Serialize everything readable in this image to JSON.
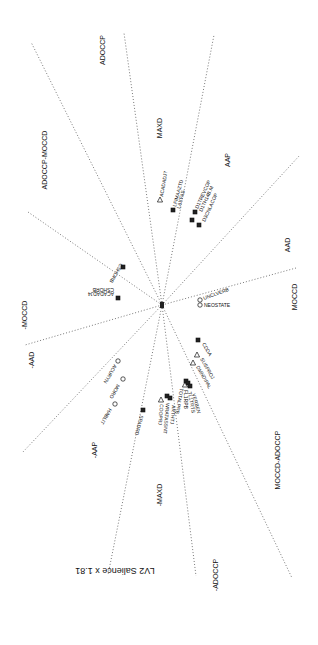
{
  "diagram": {
    "center": {
      "x": 162,
      "y": 305
    },
    "caption": "LV2 Salience x 1.81",
    "axes": [
      {
        "x2": 31,
        "y2": 42
      },
      {
        "x2": 124,
        "y2": 33
      },
      {
        "x2": 214,
        "y2": 35
      },
      {
        "x2": 300,
        "y2": 155
      },
      {
        "x2": 296,
        "y2": 268
      },
      {
        "x2": 292,
        "y2": 578
      },
      {
        "x2": 196,
        "y2": 576
      },
      {
        "x2": 108,
        "y2": 575
      },
      {
        "x2": 22,
        "y2": 453
      },
      {
        "x2": 25,
        "y2": 345
      },
      {
        "x2": 28,
        "y2": 212
      }
    ],
    "regions": [
      {
        "label": "ADOCCP",
        "x": 105,
        "y": 50,
        "rotate": -90
      },
      {
        "label": "ADOCCP-MOCCD",
        "x": 47,
        "y": 160,
        "rotate": -90
      },
      {
        "label": "MAXD",
        "x": 162,
        "y": 128,
        "rotate": -90
      },
      {
        "label": "AAP",
        "x": 230,
        "y": 160,
        "rotate": -90
      },
      {
        "label": "AAD",
        "x": 290,
        "y": 245,
        "rotate": -90
      },
      {
        "label": "MOCCD",
        "x": 297,
        "y": 297,
        "rotate": -90
      },
      {
        "label": "MOCCD-ADOCCP",
        "x": 280,
        "y": 460,
        "rotate": -90
      },
      {
        "label": "-ADOCCP",
        "x": 218,
        "y": 575,
        "rotate": -90
      },
      {
        "label": "-MAXD",
        "x": 162,
        "y": 495,
        "rotate": -90
      },
      {
        "label": "-AAP",
        "x": 97,
        "y": 450,
        "rotate": -90
      },
      {
        "label": "-AAD",
        "x": 34,
        "y": 360,
        "rotate": -90
      },
      {
        "label": "-MOCCD",
        "x": 27,
        "y": 315,
        "rotate": -90
      }
    ],
    "points": [
      {
        "label": "ACADADJ7",
        "marker": "triangle",
        "x": 160,
        "y": 200,
        "lx": 163,
        "ly": 197,
        "rotate": -80
      },
      {
        "label": "LFIMAAZTD",
        "marker": "square",
        "x": 173,
        "y": 210,
        "lx": 176,
        "ly": 207,
        "rotate": -75
      },
      {
        "label": "LAXFAS",
        "marker": "none",
        "x": 178,
        "y": 212,
        "lx": 180,
        "ly": 209,
        "rotate": -75
      },
      {
        "label": "D1TREVCOP",
        "marker": "square",
        "x": 195,
        "y": 212,
        "lx": 198,
        "ly": 209,
        "rotate": -65
      },
      {
        "label": "D1TH14B.M",
        "marker": "none",
        "x": 200,
        "y": 214,
        "lx": 202,
        "ly": 212,
        "rotate": -65
      },
      {
        "label": "D3CNLACOP",
        "marker": "square",
        "x": 199,
        "y": 225,
        "lx": 205,
        "ly": 222,
        "rotate": -65
      },
      {
        "label": "",
        "marker": "square",
        "x": 192,
        "y": 220,
        "lx": 0,
        "ly": 0,
        "rotate": 0
      },
      {
        "label": "CSHORB",
        "marker": "square",
        "x": 123,
        "y": 267,
        "lx": 120,
        "ly": 263,
        "rotate": 120
      },
      {
        "label": "ACADADJ4",
        "marker": "square",
        "x": 118,
        "y": 298,
        "lx": 114,
        "ly": 292,
        "rotate": 180
      },
      {
        "label": "CSHORB",
        "marker": "none",
        "x": 118,
        "y": 292,
        "lx": 114,
        "ly": 288,
        "rotate": 180
      },
      {
        "label": "UNCLVERB",
        "marker": "circle",
        "x": 200,
        "y": 300,
        "lx": 204,
        "ly": 300,
        "rotate": -20
      },
      {
        "label": "NEOSTATE",
        "marker": "circle",
        "x": 200,
        "y": 305,
        "lx": 204,
        "ly": 307,
        "rotate": 0
      },
      {
        "label": "CDDA",
        "marker": "square",
        "x": 198,
        "y": 340,
        "lx": 202,
        "ly": 344,
        "rotate": 60
      },
      {
        "label": "SUSPROJ",
        "marker": "triangle",
        "x": 197,
        "y": 355,
        "lx": 200,
        "ly": 359,
        "rotate": 60
      },
      {
        "label": "DMNDIPAL",
        "marker": "triangle",
        "x": 193,
        "y": 363,
        "lx": 196,
        "ly": 367,
        "rotate": 60
      },
      {
        "label": "TOTALPRB",
        "marker": "triangle",
        "x": 185,
        "y": 385,
        "lx": 180,
        "ly": 388,
        "rotate": 100
      },
      {
        "label": "FL1RPB",
        "marker": "square",
        "x": 186,
        "y": 381,
        "lx": 184,
        "ly": 390,
        "rotate": 90
      },
      {
        "label": "TL1TRTS",
        "marker": "square",
        "x": 188,
        "y": 383,
        "lx": 188,
        "ly": 392,
        "rotate": 80
      },
      {
        "label": "VERBEN",
        "marker": "square",
        "x": 190,
        "y": 386,
        "lx": 192,
        "ly": 394,
        "rotate": 75
      },
      {
        "label": "COOPRJ",
        "marker": "triangle",
        "x": 161,
        "y": 400,
        "lx": 160,
        "ly": 404,
        "rotate": 95
      },
      {
        "label": "WRATASSNT",
        "marker": "square",
        "x": 167,
        "y": 396,
        "lx": 166,
        "ly": 403,
        "rotate": 95
      },
      {
        "label": "ARTHTJ",
        "marker": "square",
        "x": 170,
        "y": 398,
        "lx": 172,
        "ly": 405,
        "rotate": 95
      },
      {
        "label": "ACURYN",
        "marker": "circle",
        "x": 118,
        "y": 361,
        "lx": 114,
        "ly": 364,
        "rotate": 120
      },
      {
        "label": "MORO",
        "marker": "circle",
        "x": 123,
        "y": 379,
        "lx": 117,
        "ly": 384,
        "rotate": 120
      },
      {
        "label": "HABLIT",
        "marker": "circle",
        "x": 115,
        "y": 404,
        "lx": 109,
        "ly": 408,
        "rotate": 120
      },
      {
        "label": "SPADRD",
        "marker": "square",
        "x": 143,
        "y": 410,
        "lx": 140,
        "ly": 415,
        "rotate": 105
      }
    ]
  }
}
